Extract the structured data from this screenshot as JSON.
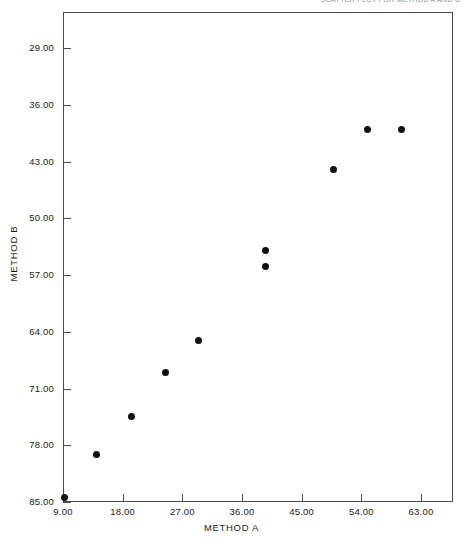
{
  "header": {
    "cut_off_text": "SCATTER PLOT FOR METHOD A AND B"
  },
  "axis": {
    "xlabel": "METHOD A",
    "ylabel": "METHOD B",
    "xticks": [
      "9.00",
      "18.00",
      "27.00",
      "36.00",
      "45.00",
      "54.00",
      "63.00"
    ],
    "yticks": [
      "85.00",
      "78.00",
      "71.00",
      "64.00",
      "57.00",
      "50.00",
      "43.00",
      "36.00",
      "29.00"
    ]
  },
  "colors": {
    "marker": "#111111",
    "frame": "#4a4a4a",
    "text": "#1a1a1a",
    "background": "#ffffff"
  },
  "chart_data": {
    "type": "scatter",
    "title": "",
    "xlabel": "METHOD A",
    "ylabel": "METHOD B",
    "xlim": [
      6.0,
      66.0
    ],
    "ylim": [
      29.0,
      89.0
    ],
    "xticks": [
      9,
      18,
      27,
      36,
      45,
      54,
      63
    ],
    "yticks": [
      29,
      36,
      43,
      50,
      57,
      64,
      71,
      78,
      85
    ],
    "grid": false,
    "legend": null,
    "x": [
      9.3,
      14.0,
      19.3,
      24.4,
      29.5,
      39.6,
      39.6,
      49.8,
      54.9,
      60.0
    ],
    "y": [
      29.5,
      34.8,
      39.5,
      45.0,
      48.9,
      60.0,
      58.1,
      70.0,
      75.0,
      75.0
    ],
    "points": [
      {
        "x": 9.3,
        "y": 29.5
      },
      {
        "x": 14.0,
        "y": 34.8
      },
      {
        "x": 19.3,
        "y": 39.5
      },
      {
        "x": 24.4,
        "y": 45.0
      },
      {
        "x": 29.5,
        "y": 48.9
      },
      {
        "x": 39.6,
        "y": 60.0
      },
      {
        "x": 39.6,
        "y": 58.1
      },
      {
        "x": 49.8,
        "y": 70.0
      },
      {
        "x": 54.9,
        "y": 75.0
      },
      {
        "x": 60.0,
        "y": 75.0
      }
    ]
  }
}
